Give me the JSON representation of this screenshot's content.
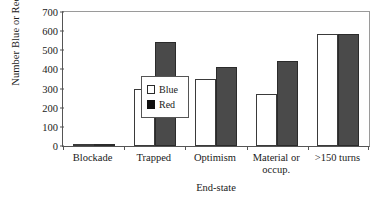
{
  "chart_data": {
    "type": "bar",
    "title": "",
    "xlabel": "End-state",
    "ylabel": "Number Blue or Red",
    "categories": [
      "Blockade",
      "Trapped",
      "Optimism",
      "Material or occup.",
      ">150 turns"
    ],
    "series": [
      {
        "name": "Blue",
        "values": [
          12,
          300,
          350,
          270,
          585
        ],
        "color": "#ffffff"
      },
      {
        "name": "Red",
        "values": [
          12,
          543,
          412,
          442,
          583
        ],
        "color": "#4a4a4a"
      }
    ],
    "ylim": [
      0,
      700
    ],
    "yticks": [
      700,
      600,
      500,
      400,
      300,
      200,
      100,
      0
    ],
    "ytick_labels": [
      "700",
      "600",
      "500",
      "400",
      "300",
      "200",
      "100",
      "0"
    ],
    "grid": false,
    "legend_position": "inside-left"
  },
  "legend": {
    "entries": [
      {
        "label": "Blue",
        "swatch": "open-square-swatch"
      },
      {
        "label": "Red",
        "swatch": "filled-square-swatch"
      }
    ]
  },
  "axis": {
    "y_title": "Number Blue or Red",
    "x_title": "End-state"
  },
  "category_labels": [
    {
      "line1": "Blockade",
      "line2": ""
    },
    {
      "line1": "Trapped",
      "line2": ""
    },
    {
      "line1": "Optimism",
      "line2": ""
    },
    {
      "line1": "Material or",
      "line2": "occup."
    },
    {
      "line1": ">150 turns",
      "line2": ""
    }
  ]
}
